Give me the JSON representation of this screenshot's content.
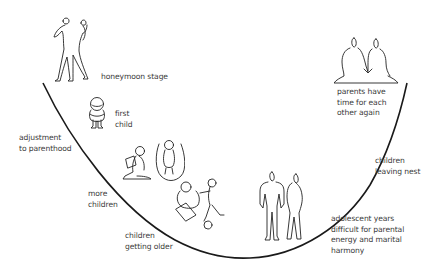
{
  "diagram": {
    "type": "family-life-cycle-u-curve",
    "curve_color": "#1a1a1a",
    "text_color": "#3a3a3a",
    "stages": [
      {
        "id": "honeymoon",
        "label": "honeymoon stage",
        "figure": "dancing-couple-icon"
      },
      {
        "id": "first-child",
        "label": "first\nchild",
        "figure": "toddler-icon"
      },
      {
        "id": "adjustment",
        "label": "adjustment\nto parenthood",
        "figure": null
      },
      {
        "id": "more-children",
        "label": "more\nchildren",
        "figure": "reading-child-and-skipping-child-icon"
      },
      {
        "id": "children-older",
        "label": "children\ngetting older",
        "figure": "children-playing-icon"
      },
      {
        "id": "adolescent",
        "label": "adolescent years\ndifficult for parental\nenergy and marital\nharmony",
        "figure": "adolescent-pair-icon"
      },
      {
        "id": "leaving-nest",
        "label": "children\nleaving nest",
        "figure": null
      },
      {
        "id": "parents-again",
        "label": "parents have\ntime for each\nother again",
        "figure": "seated-couple-holding-hands-icon"
      }
    ]
  }
}
